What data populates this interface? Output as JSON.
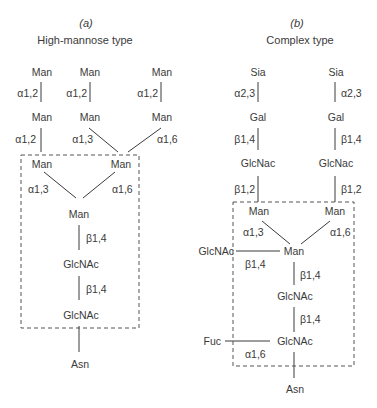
{
  "panels": {
    "a": {
      "label": "(a)",
      "title": "High-mannose type",
      "nodes": {
        "man_top_1": "Man",
        "man_top_2": "Man",
        "man_top_3": "Man",
        "man_mid_1": "Man",
        "man_mid_2": "Man",
        "man_mid_3": "Man",
        "man_core_l": "Man",
        "man_core_r": "Man",
        "man_core_c": "Man",
        "glcnac_1": "GlcNAc",
        "glcnac_2": "GlcNAc",
        "asn": "Asn"
      },
      "linkages": {
        "l1": "α1,2",
        "l2": "α1,2",
        "l3": "α1,2",
        "l4": "α1,2",
        "l5": "α1,3",
        "l6": "α1,6",
        "l7": "α1,3",
        "l8": "α1,6",
        "l9": "β1,4",
        "l10": "β1,4"
      }
    },
    "b": {
      "label": "(b)",
      "title": "Complex type",
      "nodes": {
        "sia_l": "Sia",
        "sia_r": "Sia",
        "gal_l": "Gal",
        "gal_r": "Gal",
        "glcnac_l": "GlcNac",
        "glcnac_r": "GlcNac",
        "man_l": "Man",
        "man_r": "Man",
        "man_c": "Man",
        "glcnac_bisect": "GlcNAc",
        "glcnac_1": "GlcNAc",
        "glcnac_2": "GlcNAc",
        "fuc": "Fuc",
        "asn": "Asn"
      },
      "linkages": {
        "l1": "α2,3",
        "l2": "α2,3",
        "l3": "β1,4",
        "l4": "β1,4",
        "l5": "β1,2",
        "l6": "β1,2",
        "l7": "α1,3",
        "l8": "α1,6",
        "l9": "β1,4",
        "l10": "β1,4",
        "l11": "β1,4",
        "l12": "α1,6"
      }
    }
  }
}
